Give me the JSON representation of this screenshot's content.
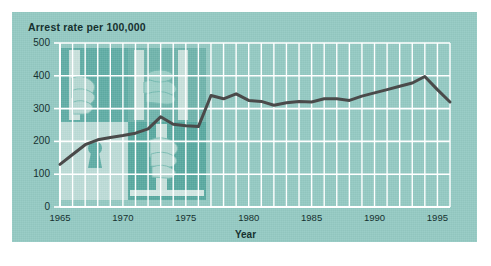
{
  "figure": {
    "panel_color": "#93c9c2",
    "page_color": "#ffffff",
    "gridline_color": "#ffffff",
    "axis_text_color": "#163130",
    "line_color": "#4a4a4a"
  },
  "chart_data": {
    "type": "line",
    "title": "Arrest rate per 100,000",
    "xlabel": "Year",
    "ylabel": "Arrest rate per 100,000",
    "xlim": [
      1965,
      1996
    ],
    "ylim": [
      0,
      500
    ],
    "ytick_labels": [
      "0",
      "100",
      "200",
      "300",
      "400",
      "500"
    ],
    "ytick_values": [
      0,
      100,
      200,
      300,
      400,
      500
    ],
    "xtick_labels": [
      "1965",
      "1970",
      "1975",
      "1980",
      "1985",
      "1990",
      "1995"
    ],
    "xtick_values": [
      1965,
      1970,
      1975,
      1980,
      1985,
      1990,
      1995
    ],
    "grid": "vertical-yearly-and-horizontal-major",
    "legend": "none",
    "series": [
      {
        "name": "Arrest rate",
        "x": [
          1965,
          1966,
          1967,
          1968,
          1969,
          1970,
          1971,
          1972,
          1973,
          1974,
          1975,
          1976,
          1977,
          1978,
          1979,
          1980,
          1981,
          1982,
          1983,
          1984,
          1985,
          1986,
          1987,
          1988,
          1989,
          1990,
          1991,
          1992,
          1993,
          1994,
          1995,
          1996
        ],
        "values": [
          130,
          160,
          190,
          205,
          212,
          218,
          225,
          238,
          275,
          252,
          248,
          245,
          340,
          330,
          345,
          325,
          322,
          310,
          318,
          322,
          320,
          330,
          330,
          325,
          338,
          348,
          358,
          368,
          378,
          398,
          358,
          320
        ]
      }
    ]
  },
  "illustration": {
    "name": "prison-bars-hands-keyhole-collage",
    "panels": [
      "hand-gripping-bar-top-left",
      "hands-on-bars-top-right",
      "keyhole-bottom-left",
      "hand-gripping-bar-bottom-right"
    ]
  }
}
